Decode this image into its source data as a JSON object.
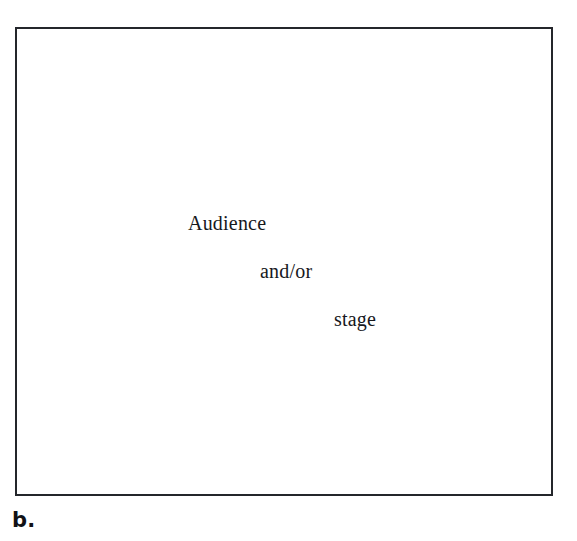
{
  "page": {
    "background_color": "#ffffff",
    "width": 577,
    "height": 541
  },
  "figure": {
    "panel_label": "b.",
    "frame": {
      "border_color": "#24262b",
      "border_width_px": 2,
      "fill_color": "#ffffff"
    },
    "text_color": "#17181c",
    "lines": [
      {
        "text": "Audience",
        "indent_level": 0
      },
      {
        "text": "and/or",
        "indent_level": 1
      },
      {
        "text": "stage",
        "indent_level": 2
      }
    ]
  }
}
